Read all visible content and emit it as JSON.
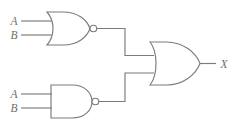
{
  "diagram": {
    "line_color": "#7b7b7b",
    "label_color": "#6d6d6d",
    "background": "#ffffff"
  },
  "labels": {
    "nor_input_a": "A",
    "nor_input_b": "B",
    "nand_input_a": "A",
    "nand_input_b": "B",
    "output_x": "X"
  },
  "gates": [
    {
      "id": "nor-gate",
      "type": "NOR",
      "has_bubble": true,
      "inputs": [
        "A",
        "B"
      ],
      "output": "nor-out"
    },
    {
      "id": "nand-gate",
      "type": "NAND",
      "has_bubble": true,
      "inputs": [
        "A",
        "B"
      ],
      "output": "nand-out"
    },
    {
      "id": "or-gate",
      "type": "OR",
      "has_bubble": false,
      "inputs": [
        "nor-out",
        "nand-out"
      ],
      "output": "X"
    }
  ],
  "nets": [
    {
      "id": "net-nor-to-or",
      "from": "nor-gate",
      "to": "or-gate"
    },
    {
      "id": "net-nand-to-or",
      "from": "nand-gate",
      "to": "or-gate"
    },
    {
      "id": "net-output",
      "from": "or-gate",
      "to": "X"
    }
  ]
}
